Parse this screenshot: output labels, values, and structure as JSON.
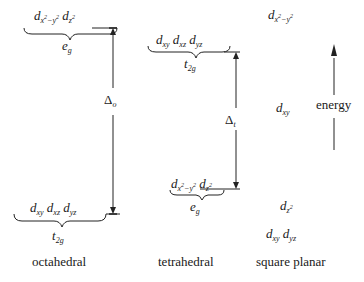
{
  "diagram": {
    "columns": [
      {
        "name": "octahedral",
        "caption": "octahedral",
        "upper": {
          "orbitals": [
            "d_{x²−y²}",
            "d_{z²}"
          ],
          "label": "e_g"
        },
        "lower": {
          "orbitals": [
            "d_{xy}",
            "d_{xz}",
            "d_{yz}"
          ],
          "label": "t_2g"
        },
        "gap_label": "Δ_o"
      },
      {
        "name": "tetrahedral",
        "caption": "tetrahedral",
        "upper": {
          "orbitals": [
            "d_{xy}",
            "d_{xz}",
            "d_{yz}"
          ],
          "label": "t_2g"
        },
        "lower": {
          "orbitals": [
            "d_{x²−y²}",
            "d_{z²}"
          ],
          "label": "e_g"
        },
        "gap_label": "Δ_t"
      },
      {
        "name": "square-planar",
        "caption": "square planar",
        "levels": [
          "d_{x²−y²}",
          "d_{xy}",
          "d_{z²}",
          "d_{xy} d_{yz}"
        ]
      }
    ],
    "axis": {
      "label": "energy",
      "direction": "up"
    }
  },
  "text": {
    "oct_caption": "octahedral",
    "tet_caption": "tetrahedral",
    "sq_caption": "square planar",
    "energy": "energy",
    "delta": "Δ",
    "oct_sub": "o",
    "tet_sub": "t",
    "d": "d",
    "xy": "xy",
    "xz": "xz",
    "yz": "yz",
    "x": "x",
    "y": "y",
    "z": "z",
    "two": "2",
    "minus": "−",
    "e": "e",
    "g": "g",
    "t": "t",
    "twog": "2g"
  }
}
